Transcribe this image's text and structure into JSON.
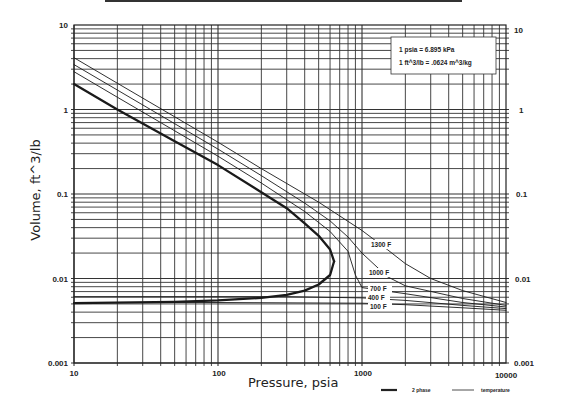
{
  "chart_data": {
    "type": "line",
    "title": "",
    "xlabel": "Pressure,  psia",
    "ylabel": "Volume, ft^3/lb",
    "xscale": "log",
    "yscale": "log",
    "xlim": [
      10,
      10000
    ],
    "ylim": [
      0.001,
      10
    ],
    "x_ticks": [
      "10",
      "100",
      "1000",
      "10000"
    ],
    "y_ticks_left": [
      "10",
      "1",
      "0.1",
      "0.01",
      "0.001"
    ],
    "y_ticks_right": [
      "10",
      "1",
      "0.1",
      "0.01",
      "0.001"
    ],
    "grid": true,
    "annotation_box": [
      "1 psia = 6.895 kPa",
      "1 ft^3/lb = .0624 m^3/kg"
    ],
    "legend": [
      {
        "label": "2 phase",
        "style": "thick"
      },
      {
        "label": "temperature",
        "style": "thin"
      }
    ],
    "legend_position": "bottom-right, below plot",
    "series": [
      {
        "name": "2 phase (saturated vapor)",
        "style": "thick",
        "x": [
          10,
          20,
          50,
          100,
          200,
          300,
          400,
          500,
          600,
          640
        ],
        "y": [
          2.0,
          1.0,
          0.42,
          0.22,
          0.105,
          0.068,
          0.045,
          0.032,
          0.022,
          0.016
        ]
      },
      {
        "name": "2 phase (saturated liquid)",
        "style": "thick",
        "x": [
          10,
          50,
          100,
          200,
          300,
          400,
          500,
          600,
          640
        ],
        "y": [
          0.0051,
          0.0053,
          0.0055,
          0.0059,
          0.0064,
          0.0072,
          0.0085,
          0.011,
          0.016
        ]
      },
      {
        "name": "1300 F",
        "style": "thin",
        "label": "1300 F",
        "x": [
          10,
          20,
          50,
          100,
          200,
          500,
          1000,
          1500,
          2000,
          3000,
          5000,
          10000
        ],
        "y": [
          4.1,
          2.05,
          0.82,
          0.41,
          0.2,
          0.08,
          0.037,
          0.022,
          0.015,
          0.01,
          0.0072,
          0.0052
        ]
      },
      {
        "name": "1000 F",
        "style": "thin",
        "label": "1000 F",
        "x": [
          10,
          20,
          50,
          100,
          200,
          400,
          600,
          800,
          1000,
          1500,
          2000,
          5000,
          10000
        ],
        "y": [
          3.4,
          1.7,
          0.68,
          0.34,
          0.165,
          0.078,
          0.048,
          0.031,
          0.02,
          0.0105,
          0.0082,
          0.0058,
          0.0048
        ]
      },
      {
        "name": "700 F",
        "style": "thin",
        "label": "700 F",
        "x": [
          10,
          20,
          50,
          100,
          200,
          400,
          600,
          800,
          900,
          1000,
          2000,
          5000,
          10000
        ],
        "y": [
          2.8,
          1.4,
          0.56,
          0.28,
          0.135,
          0.062,
          0.036,
          0.021,
          0.011,
          0.0078,
          0.0066,
          0.0052,
          0.0046
        ]
      },
      {
        "name": "400 F",
        "style": "thin",
        "label": "400 F",
        "x": [
          10,
          100,
          300,
          1000,
          2000,
          5000,
          10000
        ],
        "y": [
          0.0061,
          0.0061,
          0.0061,
          0.0059,
          0.0055,
          0.0048,
          0.0044
        ]
      },
      {
        "name": "100 F",
        "style": "thin",
        "label": "100 F",
        "x": [
          10,
          100,
          1000,
          2000,
          5000,
          10000
        ],
        "y": [
          0.0052,
          0.0052,
          0.0051,
          0.0049,
          0.0045,
          0.0042
        ]
      }
    ]
  },
  "labels": {
    "xlabel": "Pressure,  psia",
    "ylabel": "Volume, ft^3/lb",
    "note_line1": "1 psia = 6.895 kPa",
    "note_line2": "1 ft^3/lb = .0624 m^3/kg",
    "legend_2phase": "2 phase",
    "legend_temperature": "temperature",
    "curve_1300": "1300 F",
    "curve_1000": "1000 F",
    "curve_700": "700 F",
    "curve_400": "400 F",
    "curve_100": "100 F",
    "x_tick_10": "10",
    "x_tick_100": "100",
    "x_tick_1000": "1000",
    "x_tick_10000": "10000",
    "yl_10": "10",
    "yl_1": "1",
    "yl_01": "0.1",
    "yl_001": "0.01",
    "yl_0001": "0.001",
    "yr_10": "10",
    "yr_1": "1",
    "yr_01": "0.1",
    "yr_001": "0.01",
    "yr_0001": "0.001"
  }
}
